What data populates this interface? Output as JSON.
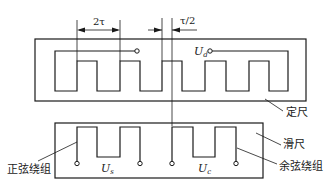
{
  "diagram": {
    "dimensions": {
      "pitch_label": "2τ",
      "offset_label": "τ/2"
    },
    "stator": {
      "label": "定尺",
      "terminal_symbol": "U",
      "terminal_subscript": "d"
    },
    "slider": {
      "label": "滑尺",
      "sine_winding": {
        "label": "正弦绕组",
        "terminal_symbol": "U",
        "terminal_subscript": "s"
      },
      "cosine_winding": {
        "label": "余弦绕组",
        "terminal_symbol": "U",
        "terminal_subscript": "c"
      }
    },
    "colors": {
      "line": "#1a1a1a",
      "background": "#ffffff"
    }
  }
}
